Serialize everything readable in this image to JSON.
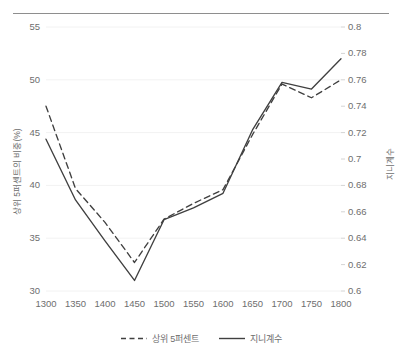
{
  "chart_data": {
    "type": "line",
    "title": "",
    "subtitle": "",
    "xlabel": "",
    "ylabel": "상위 5퍼센트의 비중(%)",
    "y2label": "지니계수",
    "x": [
      1300,
      1350,
      1400,
      1450,
      1500,
      1550,
      1600,
      1650,
      1700,
      1750,
      1800
    ],
    "categories": [
      "1300",
      "1350",
      "1400",
      "1450",
      "1500",
      "1550",
      "1600",
      "1650",
      "1700",
      "1750",
      "1800"
    ],
    "xlim": [
      1300,
      1800
    ],
    "ylim": [
      30,
      55
    ],
    "y2lim": [
      0.6,
      0.8
    ],
    "yticks": [
      "55",
      "50",
      "45",
      "40",
      "35",
      "30"
    ],
    "ytick_values": [
      55,
      50,
      45,
      40,
      35,
      30
    ],
    "y2ticks": [
      "0.8",
      "0.78",
      "0.76",
      "0.74",
      "0.72",
      "0.7",
      "0.68",
      "0.66",
      "0.64",
      "0.62",
      "0.6"
    ],
    "y2tick_values": [
      0.8,
      0.78,
      0.76,
      0.74,
      0.72,
      0.7,
      0.68,
      0.66,
      0.64,
      0.62,
      0.6
    ],
    "grid": true,
    "grid_axis": "y",
    "legend_position": "bottom",
    "series": [
      {
        "name": "상위 5퍼센트",
        "axis": "left",
        "style": "dashed",
        "color": "#404040",
        "values": [
          47.5,
          39.7,
          36.5,
          32.7,
          36.8,
          38.3,
          39.6,
          44.8,
          49.6,
          48.3,
          50.0
        ]
      },
      {
        "name": "지니계수",
        "axis": "right",
        "style": "solid",
        "color": "#404040",
        "values": [
          0.715,
          0.669,
          0.638,
          0.608,
          0.654,
          0.663,
          0.674,
          0.722,
          0.758,
          0.753,
          0.776
        ]
      }
    ]
  },
  "legend": {
    "items": [
      {
        "label": "상위 5퍼센트",
        "style": "dashed"
      },
      {
        "label": "지니계수",
        "style": "solid"
      }
    ]
  },
  "colors": {
    "line": "#404040",
    "grid": "#f2f2f2",
    "text": "#6e6e6e",
    "rule": "#8e8e8e",
    "background": "#ffffff"
  },
  "top_rule": {
    "visible": true
  }
}
